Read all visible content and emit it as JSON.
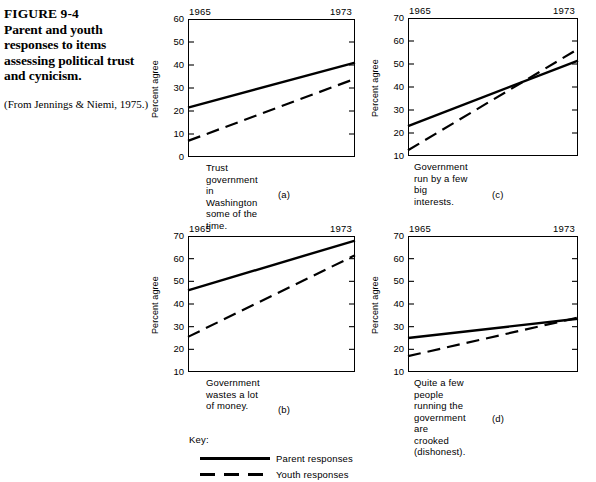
{
  "figure": {
    "number": "FIGURE 9-4",
    "caption": "Parent and youth responses to items assessing political trust and cynicism.",
    "source": "(From Jennings & Niemi, 1975.)"
  },
  "key": {
    "title": "Key:",
    "parent_label": "Parent responses",
    "youth_label": "Youth responses"
  },
  "chart_data": [
    {
      "type": "line",
      "panel": "(a)",
      "title": "Trust government in Washington\nsome of the time.",
      "xlabel": "",
      "ylabel": "Percent agree",
      "x": [
        1965,
        1973
      ],
      "xticklabels": [
        "1965",
        "1973"
      ],
      "ylim": [
        0,
        60
      ],
      "yticks": [
        0,
        10,
        20,
        30,
        40,
        50,
        60
      ],
      "grid": false,
      "legend": "external",
      "series": [
        {
          "name": "Parent responses",
          "style": "solid",
          "values": [
            21.5,
            41.0
          ]
        },
        {
          "name": "Youth responses",
          "style": "dashed",
          "values": [
            7.0,
            34.0
          ]
        }
      ]
    },
    {
      "type": "line",
      "panel": "(b)",
      "title": "Government wastes a lot of money.",
      "xlabel": "",
      "ylabel": "Percent agree",
      "x": [
        1965,
        1973
      ],
      "xticklabels": [
        "1965",
        "1973"
      ],
      "ylim": [
        10,
        70
      ],
      "yticks": [
        10,
        20,
        30,
        40,
        50,
        60,
        70
      ],
      "grid": false,
      "legend": "external",
      "series": [
        {
          "name": "Parent responses",
          "style": "solid",
          "values": [
            46.0,
            68.0
          ]
        },
        {
          "name": "Youth responses",
          "style": "dashed",
          "values": [
            25.5,
            61.5
          ]
        }
      ]
    },
    {
      "type": "line",
      "panel": "(c)",
      "title": "Government run by a few big interests.",
      "xlabel": "",
      "ylabel": "Percent agree",
      "x": [
        1965,
        1973
      ],
      "xticklabels": [
        "1965",
        "1973"
      ],
      "ylim": [
        10,
        70
      ],
      "yticks": [
        10,
        20,
        30,
        40,
        50,
        60,
        70
      ],
      "grid": false,
      "legend": "external",
      "series": [
        {
          "name": "Parent responses",
          "style": "solid",
          "values": [
            23.0,
            51.5
          ]
        },
        {
          "name": "Youth responses",
          "style": "dashed",
          "values": [
            12.5,
            56.5
          ]
        }
      ]
    },
    {
      "type": "line",
      "panel": "(d)",
      "title": "Quite a few people running the\ngovernment are crooked (dishonest).",
      "xlabel": "",
      "ylabel": "Percent agree",
      "x": [
        1965,
        1973
      ],
      "xticklabels": [
        "1965",
        "1973"
      ],
      "ylim": [
        10,
        70
      ],
      "yticks": [
        10,
        20,
        30,
        40,
        50,
        60,
        70
      ],
      "grid": false,
      "legend": "external",
      "series": [
        {
          "name": "Parent responses",
          "style": "solid",
          "values": [
            25.0,
            33.5
          ]
        },
        {
          "name": "Youth responses",
          "style": "dashed",
          "values": [
            17.0,
            34.0
          ]
        }
      ]
    }
  ]
}
